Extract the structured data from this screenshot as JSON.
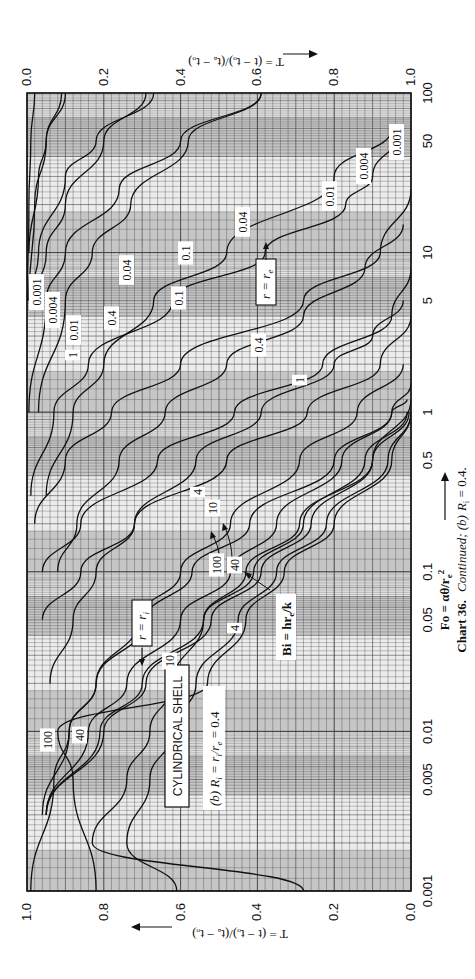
{
  "figure": {
    "caption_bold": "Chart 36.",
    "caption_italic": "Continued; (b)",
    "caption_tail": "R",
    "caption_sub": "i",
    "caption_value": " = 0.4.",
    "title_box": "CYLINDRICAL  SHELL",
    "subtitle": "(b)  R",
    "subtitle_sub": "i",
    "subtitle_tail": " = r",
    "subtitle_tail_sub1": "i",
    "subtitle_tail2": "/r",
    "subtitle_tail_sub2": "e",
    "subtitle_value": " = 0.4",
    "r_inner_label": "r = r",
    "r_inner_sub": "i",
    "r_outer_label": "r = r",
    "r_outer_sub": "e",
    "bi_label": "Bi = hr",
    "bi_sub": "e",
    "bi_tail": "/k",
    "x_axis_title": "Fo = αθ/r",
    "x_axis_title_sub": "e",
    "x_axis_title_sup": "2",
    "left_axis_title": "T = (t − tₒ)/(tₐ − tₒ)",
    "right_axis_title": "T = (t − tₒ)/(tₐ − tₒ)"
  },
  "chart_data": {
    "type": "line",
    "xlabel": "Fo = αθ/re²",
    "ylabel": "T = (t − to)/(ta − to)",
    "x_scale": "log",
    "xlim": [
      0.001,
      100
    ],
    "ylim": [
      0.0,
      1.0
    ],
    "orientation": "rotated 90° (Fo axis vertical, increasing upward; T axis horizontal)",
    "grid": true,
    "fo_ticks": [
      0.001,
      0.005,
      0.01,
      0.05,
      0.1,
      0.5,
      1,
      5,
      10,
      50,
      100
    ],
    "fo_tick_labels": [
      "0.001",
      "0.005",
      "0.01",
      "0.05",
      "0.1",
      "0.5",
      "1",
      "5",
      "10",
      "50",
      "100"
    ],
    "t_ticks_inner": [
      "1.0",
      "0.8",
      "0.6",
      "0.4",
      "0.2",
      "0.0"
    ],
    "t_ticks_outer": [
      "0.0",
      "0.2",
      "0.4",
      "0.6",
      "0.8",
      "1.0"
    ],
    "parameter": "Bi = hre/k",
    "series_inner_r_eq_ri": [
      {
        "name": "Bi=0.001",
        "label": "0.001",
        "points": [
          [
            100,
            0.9
          ],
          [
            50,
            0.95
          ],
          [
            30,
            0.97
          ],
          [
            10,
            0.995
          ]
        ]
      },
      {
        "name": "Bi=0.004",
        "label": "0.004",
        "points": [
          [
            100,
            0.67
          ],
          [
            50,
            0.82
          ],
          [
            30,
            0.9
          ],
          [
            10,
            0.97
          ],
          [
            5,
            0.99
          ]
        ]
      },
      {
        "name": "Bi=0.01",
        "label": "0.01",
        "points": [
          [
            100,
            0.39
          ],
          [
            50,
            0.6
          ],
          [
            25,
            0.76
          ],
          [
            10,
            0.9
          ],
          [
            5,
            0.95
          ],
          [
            1,
            0.995
          ]
        ]
      },
      {
        "name": "Bi=0.04",
        "label": "0.04",
        "points": [
          [
            60,
            0.02
          ],
          [
            30,
            0.1
          ],
          [
            20,
            0.17
          ],
          [
            10,
            0.38
          ],
          [
            5,
            0.62
          ],
          [
            2,
            0.84
          ],
          [
            1,
            0.93
          ],
          [
            0.3,
            0.99
          ]
        ]
      },
      {
        "name": "Bi=0.1",
        "label": "0.1",
        "points": [
          [
            25,
            0.0
          ],
          [
            10,
            0.08
          ],
          [
            5,
            0.28
          ],
          [
            2,
            0.6
          ],
          [
            1,
            0.78
          ],
          [
            0.5,
            0.9
          ],
          [
            0.2,
            0.98
          ]
        ]
      },
      {
        "name": "Bi=0.4",
        "label": "0.4",
        "points": [
          [
            8,
            0.0
          ],
          [
            4,
            0.05
          ],
          [
            2,
            0.23
          ],
          [
            1,
            0.46
          ],
          [
            0.5,
            0.66
          ],
          [
            0.2,
            0.86
          ],
          [
            0.1,
            0.96
          ]
        ]
      },
      {
        "name": "Bi=1",
        "label": "1",
        "points": [
          [
            4,
            0.0
          ],
          [
            2,
            0.08
          ],
          [
            1,
            0.27
          ],
          [
            0.5,
            0.48
          ],
          [
            0.2,
            0.72
          ],
          [
            0.1,
            0.86
          ],
          [
            0.05,
            0.96
          ]
        ]
      },
      {
        "name": "Bi=4",
        "label": "4",
        "points": [
          [
            1.5,
            0.0
          ],
          [
            1,
            0.05
          ],
          [
            0.5,
            0.2
          ],
          [
            0.2,
            0.42
          ],
          [
            0.1,
            0.57
          ],
          [
            0.05,
            0.69
          ],
          [
            0.02,
            0.82
          ],
          [
            0.01,
            0.89
          ],
          [
            0.005,
            0.93
          ],
          [
            0.001,
            0.99
          ]
        ]
      },
      {
        "name": "Bi=10",
        "label": "10",
        "points": [
          [
            1.2,
            0.0
          ],
          [
            0.5,
            0.1
          ],
          [
            0.2,
            0.29
          ],
          [
            0.1,
            0.43
          ],
          [
            0.05,
            0.54
          ],
          [
            0.02,
            0.62
          ],
          [
            0.01,
            0.68
          ],
          [
            0.005,
            0.74
          ],
          [
            0.002,
            0.83
          ],
          [
            0.001,
            0.28
          ]
        ]
      },
      {
        "name": "Bi=40",
        "label": "40",
        "points": [
          [
            1,
            0.0
          ],
          [
            0.5,
            0.06
          ],
          [
            0.2,
            0.22
          ],
          [
            0.1,
            0.35
          ],
          [
            0.05,
            0.45
          ],
          [
            0.02,
            0.56
          ],
          [
            0.01,
            0.62
          ],
          [
            0.005,
            0.68
          ],
          [
            0.002,
            0.74
          ],
          [
            0.001,
            0.61
          ]
        ]
      },
      {
        "name": "Bi=100",
        "label": "100",
        "points": [
          [
            1,
            0.0
          ],
          [
            0.5,
            0.05
          ],
          [
            0.2,
            0.2
          ],
          [
            0.1,
            0.33
          ],
          [
            0.05,
            0.43
          ],
          [
            0.02,
            0.53
          ],
          [
            0.01,
            0.92
          ],
          [
            0.005,
            0.88
          ],
          [
            0.001,
            0.82
          ]
        ]
      }
    ],
    "series_outer_r_eq_re": [
      {
        "name": "Bi=0.001",
        "label": "0.001",
        "points": [
          [
            100,
            0.02
          ],
          [
            50,
            0.01
          ],
          [
            20,
            0.005
          ],
          [
            5,
            0.001
          ]
        ]
      },
      {
        "name": "Bi=0.004",
        "label": "0.004",
        "points": [
          [
            100,
            0.09
          ],
          [
            50,
            0.05
          ],
          [
            20,
            0.02
          ],
          [
            5,
            0.005
          ]
        ]
      },
      {
        "name": "Bi=0.01",
        "label": "0.01",
        "points": [
          [
            100,
            0.31
          ],
          [
            50,
            0.2
          ],
          [
            20,
            0.1
          ],
          [
            10,
            0.05
          ],
          [
            5,
            0.02
          ]
        ]
      },
      {
        "name": "Bi=0.04",
        "label": "0.04",
        "points": [
          [
            100,
            0.61
          ],
          [
            50,
            0.42
          ],
          [
            20,
            0.27
          ],
          [
            10,
            0.17
          ],
          [
            5,
            0.1
          ],
          [
            1,
            0.03
          ]
        ]
      },
      {
        "name": "Bi=0.1",
        "label": "0.1",
        "points": [
          [
            60,
            0.95
          ],
          [
            30,
            0.8
          ],
          [
            10,
            0.52
          ],
          [
            5,
            0.33
          ],
          [
            2,
            0.2
          ],
          [
            1,
            0.12
          ],
          [
            0.3,
            0.05
          ]
        ]
      },
      {
        "name": "Bi=0.4",
        "label": "0.4",
        "points": [
          [
            15,
            0.98
          ],
          [
            8,
            0.88
          ],
          [
            4,
            0.72
          ],
          [
            2,
            0.52
          ],
          [
            1,
            0.36
          ],
          [
            0.5,
            0.24
          ],
          [
            0.2,
            0.13
          ],
          [
            0.1,
            0.08
          ]
        ]
      },
      {
        "name": "Bi=1",
        "label": "1",
        "points": [
          [
            5,
            0.98
          ],
          [
            3,
            0.9
          ],
          [
            2,
            0.8
          ],
          [
            1,
            0.61
          ],
          [
            0.5,
            0.44
          ],
          [
            0.2,
            0.28
          ],
          [
            0.1,
            0.18
          ],
          [
            0.05,
            0.12
          ],
          [
            0.02,
            0.06
          ]
        ]
      },
      {
        "name": "Bi=4",
        "label": "4",
        "points": [
          [
            2,
            0.98
          ],
          [
            1,
            0.86
          ],
          [
            0.5,
            0.71
          ],
          [
            0.2,
            0.53
          ],
          [
            0.1,
            0.4
          ],
          [
            0.05,
            0.29
          ],
          [
            0.02,
            0.18
          ],
          [
            0.01,
            0.11
          ],
          [
            0.003,
            0.04
          ]
        ]
      },
      {
        "name": "Bi=10",
        "label": "10",
        "points": [
          [
            1.2,
            0.99
          ],
          [
            1,
            0.95
          ],
          [
            0.5,
            0.82
          ],
          [
            0.2,
            0.65
          ],
          [
            0.1,
            0.53
          ],
          [
            0.05,
            0.4
          ],
          [
            0.02,
            0.26
          ],
          [
            0.01,
            0.16
          ],
          [
            0.003,
            0.05
          ]
        ]
      },
      {
        "name": "Bi=40",
        "label": "40",
        "points": [
          [
            1,
            0.99
          ],
          [
            0.5,
            0.88
          ],
          [
            0.2,
            0.72
          ],
          [
            0.1,
            0.59
          ],
          [
            0.05,
            0.46
          ],
          [
            0.02,
            0.3
          ],
          [
            0.01,
            0.19
          ],
          [
            0.003,
            0.05
          ]
        ]
      },
      {
        "name": "Bi=100",
        "label": "100",
        "points": [
          [
            1,
            0.995
          ],
          [
            0.5,
            0.9
          ],
          [
            0.2,
            0.74
          ],
          [
            0.1,
            0.61
          ],
          [
            0.05,
            0.48
          ],
          [
            0.02,
            0.31
          ],
          [
            0.01,
            0.2
          ],
          [
            0.003,
            0.05
          ]
        ]
      }
    ],
    "annotations": [
      "CYLINDRICAL SHELL",
      "(b) Ri = ri/re = 0.4",
      "r = ri",
      "r = re",
      "Bi = hre/k",
      "Fo = αθ/re²"
    ],
    "colors": {
      "line": "#111111",
      "grid": "#3a3a3a",
      "shade": "#bdbdbd",
      "background": "#ffffff"
    }
  }
}
